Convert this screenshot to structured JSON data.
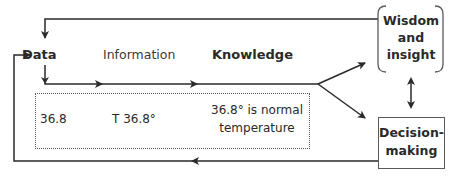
{
  "diagram": {
    "nodes": {
      "data": "Data",
      "information": "Information",
      "knowledge": "Knowledge",
      "wisdom_line1": "Wisdom",
      "wisdom_line2": "and",
      "wisdom_line3": "insight",
      "decision_line1": "Decision-",
      "decision_line2": "making"
    },
    "example": {
      "data_value": "36.8",
      "information_value": "T 36.8°",
      "knowledge_line1": "36.8° is normal",
      "knowledge_line2": "temperature"
    },
    "colors": {
      "line": "#2a2a2a",
      "text": "#2a2a2a"
    }
  }
}
